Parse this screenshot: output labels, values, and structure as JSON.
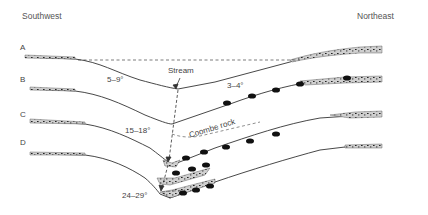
{
  "diagram": {
    "directions": {
      "left": "Southwest",
      "right": "Northeast"
    },
    "profiles": [
      {
        "id": "A",
        "label": "A"
      },
      {
        "id": "B",
        "label": "B"
      },
      {
        "id": "C",
        "label": "C"
      },
      {
        "id": "D",
        "label": "D"
      }
    ],
    "annotations": {
      "stream": "Stream",
      "coombe_rock": "Coombe rock",
      "angle_b_left": "5–9°",
      "angle_b_right": "3–4°",
      "angle_c_left": "15–18°",
      "angle_d_left": "24–29°"
    },
    "colors": {
      "line": "#333333",
      "deposit_fill": "#c8c8c8",
      "boulder": "#111111",
      "text": "#444444"
    }
  }
}
